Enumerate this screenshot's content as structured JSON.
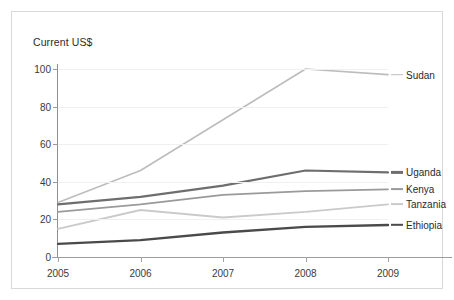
{
  "chart_data": {
    "type": "line",
    "title": "Current US$",
    "xlabel": "",
    "ylabel": "Current US$",
    "x": [
      "2005",
      "2006",
      "2007",
      "2008",
      "2009"
    ],
    "categories": [
      "2005",
      "2006",
      "2007",
      "2008",
      "2009"
    ],
    "ylim": [
      0,
      100
    ],
    "yticks": [
      0,
      20,
      40,
      60,
      80,
      100
    ],
    "grid": true,
    "legend_position": "right-line-end",
    "series": [
      {
        "name": "Sudan",
        "color": "#bdbdbd",
        "width": 1.6,
        "values": [
          29,
          46,
          73,
          100,
          97
        ]
      },
      {
        "name": "Uganda",
        "color": "#6e6e6e",
        "width": 2.2,
        "values": [
          28,
          32,
          38,
          46,
          45
        ]
      },
      {
        "name": "Kenya",
        "color": "#9a9a9a",
        "width": 1.8,
        "values": [
          24,
          28,
          33,
          35,
          36
        ]
      },
      {
        "name": "Tanzania",
        "color": "#cacaca",
        "width": 1.8,
        "values": [
          15,
          25,
          21,
          24,
          28
        ]
      },
      {
        "name": "Ethiopia",
        "color": "#4a4a4a",
        "width": 2.4,
        "values": [
          7,
          9,
          13,
          16,
          17
        ]
      }
    ]
  },
  "labels": {
    "axis_title": "Current US$"
  }
}
